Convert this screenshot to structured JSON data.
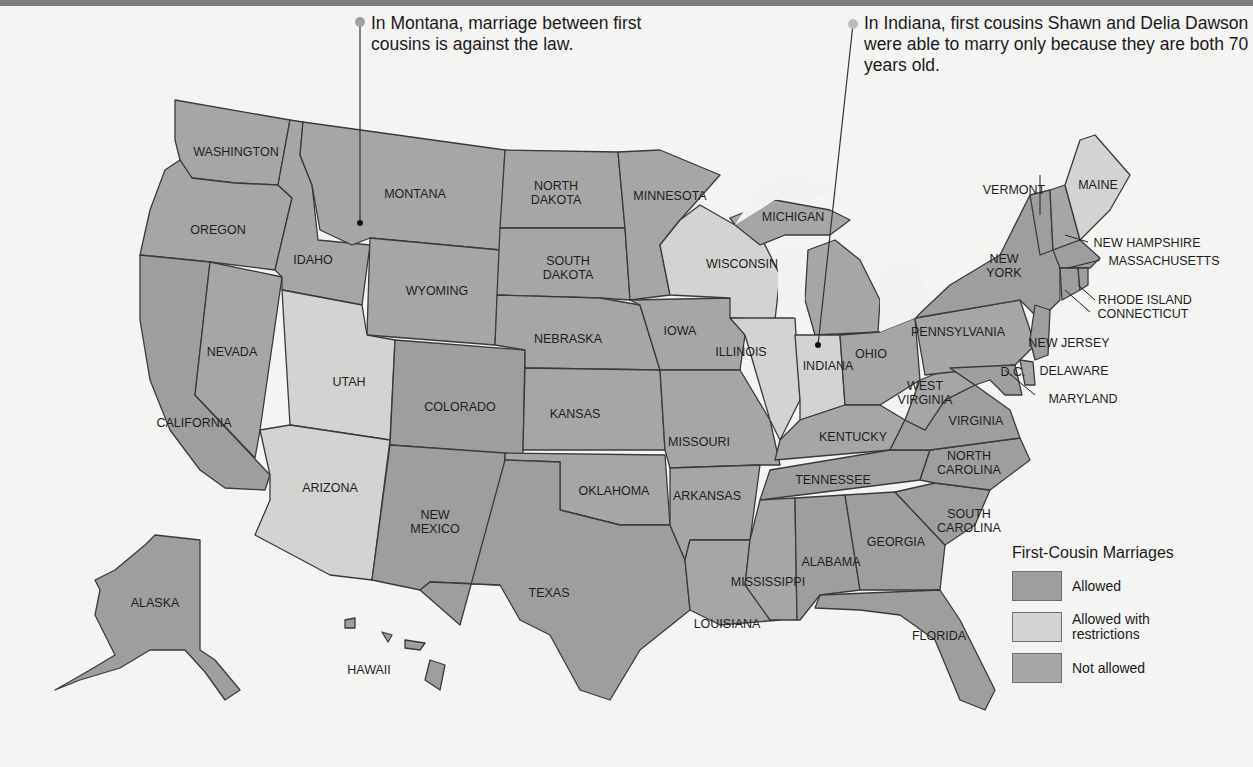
{
  "callouts": [
    {
      "id": "montana",
      "text": "In Montana, marriage between first cousins is against the law."
    },
    {
      "id": "indiana",
      "text": "In Indiana, first cousins Shawn and Delia Dawson were able to marry only because they are both 70 years old."
    }
  ],
  "legend": {
    "title": "First-Cousin Marriages",
    "items": [
      {
        "label": "Allowed",
        "color": "#9e9e9e"
      },
      {
        "label": "Allowed with restrictions",
        "color": "#d3d3d1"
      },
      {
        "label": "Not allowed",
        "color": "#a6a6a6"
      }
    ]
  },
  "states": {
    "washington": "WASHINGTON",
    "oregon": "OREGON",
    "california": "CALIFORNIA",
    "nevada": "NEVADA",
    "idaho": "IDAHO",
    "montana": "MONTANA",
    "wyoming": "WYOMING",
    "utah": "UTAH",
    "arizona": "ARIZONA",
    "colorado": "COLORADO",
    "new_mexico_1": "NEW",
    "new_mexico_2": "MEXICO",
    "north_dakota_1": "NORTH",
    "north_dakota_2": "DAKOTA",
    "south_dakota_1": "SOUTH",
    "south_dakota_2": "DAKOTA",
    "nebraska": "NEBRASKA",
    "kansas": "KANSAS",
    "oklahoma": "OKLAHOMA",
    "texas": "TEXAS",
    "minnesota": "MINNESOTA",
    "iowa": "IOWA",
    "missouri": "MISSOURI",
    "arkansas": "ARKANSAS",
    "louisiana": "LOUISIANA",
    "wisconsin": "WISCONSIN",
    "illinois": "ILLINOIS",
    "michigan": "MICHIGAN",
    "indiana": "INDIANA",
    "ohio": "OHIO",
    "kentucky": "KENTUCKY",
    "tennessee": "TENNESSEE",
    "mississippi": "MISSISSIPPI",
    "alabama": "ALABAMA",
    "georgia": "GEORGIA",
    "florida": "FLORIDA",
    "south_carolina_1": "SOUTH",
    "south_carolina_2": "CAROLINA",
    "north_carolina_1": "NORTH",
    "north_carolina_2": "CAROLINA",
    "virginia": "VIRGINIA",
    "west_virginia_1": "WEST",
    "west_virginia_2": "VIRGINIA",
    "pennsylvania": "PENNSYLVANIA",
    "new_york_1": "NEW",
    "new_york_2": "YORK",
    "vermont": "VERMONT",
    "maine": "MAINE",
    "new_hampshire": "NEW HAMPSHIRE",
    "massachusetts": "MASSACHUSETTS",
    "rhode_island": "RHODE ISLAND",
    "connecticut": "CONNECTICUT",
    "new_jersey": "NEW JERSEY",
    "delaware": "DELAWARE",
    "maryland": "MARYLAND",
    "dc": "D.C.",
    "alaska": "ALASKA",
    "hawaii": "HAWAII"
  },
  "status": {
    "allowed": [
      "Alabama",
      "Alaska",
      "California",
      "Colorado",
      "Connecticut",
      "District of Columbia",
      "Florida",
      "Georgia",
      "Hawaii",
      "Maryland",
      "Massachusetts",
      "New Jersey",
      "New Mexico",
      "New York",
      "North Carolina",
      "Rhode Island",
      "South Carolina",
      "Tennessee",
      "Texas",
      "Vermont",
      "Virginia"
    ],
    "allowed_with_restrictions": [
      "Arizona",
      "Illinois",
      "Indiana",
      "Maine",
      "Utah",
      "Wisconsin"
    ],
    "not_allowed": [
      "Arkansas",
      "Delaware",
      "Idaho",
      "Iowa",
      "Kansas",
      "Kentucky",
      "Louisiana",
      "Michigan",
      "Minnesota",
      "Mississippi",
      "Missouri",
      "Montana",
      "Nebraska",
      "Nevada",
      "New Hampshire",
      "North Dakota",
      "Ohio",
      "Oklahoma",
      "Oregon",
      "Pennsylvania",
      "South Dakota",
      "Washington",
      "West Virginia",
      "Wyoming"
    ]
  }
}
